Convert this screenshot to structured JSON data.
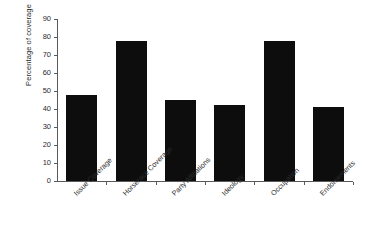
{
  "chart_data": {
    "type": "bar",
    "title": "",
    "xlabel": "",
    "ylabel": "Percentage of coverage",
    "ylim": [
      0,
      90
    ],
    "ytick_step": 10,
    "yticks": [
      0,
      10,
      20,
      30,
      40,
      50,
      60,
      70,
      80,
      90
    ],
    "grid": false,
    "legend": "none",
    "bar_color": "#0d0d0d",
    "axis_color": "#5a5a5a",
    "categories": [
      "Issue Coverage",
      "Horserace Coverage",
      "Party Affiliations",
      "Ideology",
      "Occupation",
      "Endorsements"
    ],
    "values": [
      48,
      78,
      45,
      42,
      78,
      41
    ]
  }
}
